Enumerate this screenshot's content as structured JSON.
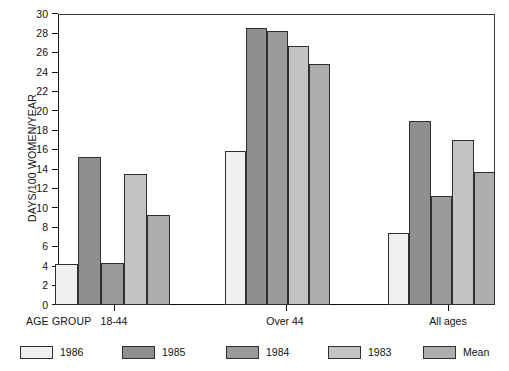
{
  "chart_data": {
    "type": "bar",
    "title": "",
    "xlabel": "AGE GROUP",
    "ylabel": "DAYS/100 WOMEN/YEAR",
    "ylim": [
      0,
      30
    ],
    "ytick_step": 2,
    "yticks": [
      "0",
      "2",
      "4",
      "6",
      "8",
      "10",
      "12",
      "14",
      "16",
      "18",
      "20",
      "22",
      "24",
      "26",
      "28",
      "30"
    ],
    "grid": false,
    "legend_position": "bottom",
    "categories": [
      "18-44",
      "Over 44",
      "All ages"
    ],
    "series": [
      {
        "name": "1986",
        "color": "#efefef",
        "values": [
          4.2,
          15.9,
          7.4
        ]
      },
      {
        "name": "1985",
        "color": "#8f8f8f",
        "values": [
          15.3,
          28.6,
          19.0
        ]
      },
      {
        "name": "1984",
        "color": "#9a9a9a",
        "values": [
          4.3,
          28.3,
          11.2
        ]
      },
      {
        "name": "1983",
        "color": "#c3c3c3",
        "values": [
          13.5,
          26.7,
          17.0
        ]
      },
      {
        "name": "Mean",
        "color": "#adadad",
        "values": [
          9.3,
          24.8,
          13.7
        ]
      }
    ]
  },
  "axis": {
    "y_label": "DAYS/100 WOMEN/YEAR",
    "x_caption": "AGE GROUP"
  },
  "legend": {
    "items": [
      {
        "label": "1986"
      },
      {
        "label": "1985"
      },
      {
        "label": "1984"
      },
      {
        "label": "1983"
      },
      {
        "label": "Mean"
      }
    ]
  }
}
